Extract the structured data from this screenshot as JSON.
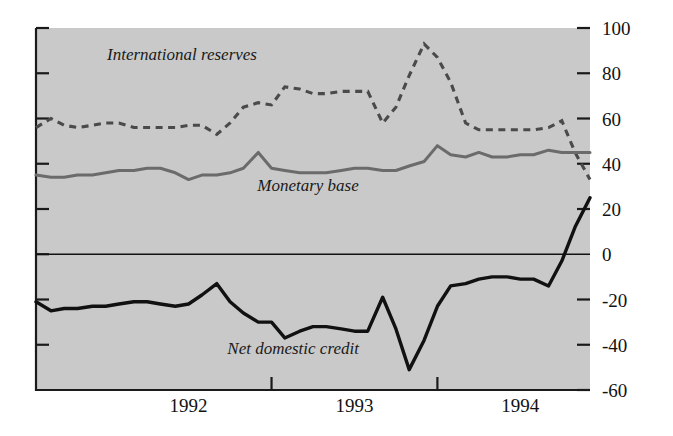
{
  "chart_data": {
    "type": "line",
    "title": "",
    "subtitle": "",
    "xlabel": "",
    "ylabel": "",
    "xlim_years": [
      1991.58,
      1994.92
    ],
    "ylim": [
      -60,
      100
    ],
    "y_ticks": [
      100,
      80,
      60,
      40,
      20,
      0,
      -20,
      -40,
      -60
    ],
    "y_tick_labels": [
      "100",
      "80",
      "60",
      "40",
      "20",
      "0",
      "-20",
      "-40",
      "-60"
    ],
    "x_tick_labels": [
      "1992",
      "1993",
      "1994"
    ],
    "x_tick_positions_year": [
      1992.5,
      1993.5,
      1994.5
    ],
    "x_boundary_years": [
      1993.0,
      1994.0
    ],
    "grid": false,
    "legend": "inline-annotations",
    "zero_line": 0,
    "background_color": "#c9c9c9",
    "page_color": "#ffffff",
    "axis_color": "#1a1a1a",
    "x": [
      1991.58,
      1991.67,
      1991.75,
      1991.83,
      1991.92,
      1992.0,
      1992.08,
      1992.17,
      1992.25,
      1992.33,
      1992.42,
      1992.5,
      1992.58,
      1992.67,
      1992.75,
      1992.83,
      1992.92,
      1993.0,
      1993.08,
      1993.17,
      1993.25,
      1993.33,
      1993.42,
      1993.5,
      1993.58,
      1993.67,
      1993.75,
      1993.83,
      1993.92,
      1994.0,
      1994.08,
      1994.17,
      1994.25,
      1994.33,
      1994.42,
      1994.5,
      1994.58,
      1994.67,
      1994.75,
      1994.83,
      1994.92
    ],
    "series": [
      {
        "name": "International reserves",
        "color": "#4a4a4a",
        "style": "dashed",
        "label_x_year": 1992.46,
        "label_y_value": 86,
        "values": [
          56,
          60,
          57,
          56,
          57,
          58,
          58,
          56,
          56,
          56,
          56,
          57,
          57,
          53,
          58,
          65,
          67,
          66,
          74,
          73,
          71,
          71,
          72,
          72,
          72,
          58,
          65,
          79,
          93,
          87,
          76,
          58,
          55,
          55,
          55,
          55,
          55,
          56,
          59,
          45,
          33
        ]
      },
      {
        "name": "Monetary base",
        "color": "#6b6b6b",
        "style": "solid",
        "label_x_year": 1993.22,
        "label_y_value": 28,
        "values": [
          35,
          34,
          34,
          35,
          35,
          36,
          37,
          37,
          38,
          38,
          36,
          33,
          35,
          35,
          36,
          38,
          45,
          38,
          37,
          36,
          36,
          36,
          37,
          38,
          38,
          37,
          37,
          39,
          41,
          48,
          44,
          43,
          45,
          43,
          43,
          44,
          44,
          46,
          45,
          45,
          45
        ]
      },
      {
        "name": "Net domestic credit",
        "color": "#111111",
        "style": "solid",
        "label_x_year": 1993.13,
        "label_y_value": -44,
        "values": [
          -21,
          -25,
          -24,
          -24,
          -23,
          -23,
          -22,
          -21,
          -21,
          -22,
          -23,
          -22,
          -18,
          -13,
          -21,
          -26,
          -30,
          -30,
          -37,
          -34,
          -32,
          -32,
          -33,
          -34,
          -34,
          -19,
          -33,
          -51,
          -38,
          -23,
          -14,
          -13,
          -11,
          -10,
          -10,
          -11,
          -11,
          -14,
          -3,
          12,
          25
        ]
      }
    ],
    "annotations": [
      {
        "text": "International reserves",
        "style": "italic"
      },
      {
        "text": "Monetary base",
        "style": "italic"
      },
      {
        "text": "Net domestic credit",
        "style": "italic"
      }
    ]
  }
}
